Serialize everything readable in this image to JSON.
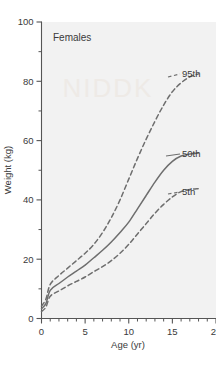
{
  "chart_data": {
    "type": "line",
    "title": "Females",
    "xlabel": "Age (yr)",
    "ylabel": "Weight (kg)",
    "xlim": [
      0,
      20
    ],
    "ylim": [
      0,
      100
    ],
    "xticks": [
      0,
      5,
      10,
      15,
      20
    ],
    "xtick_labels": [
      "0",
      "5",
      "10",
      "15",
      "20"
    ],
    "xminor_step": 1,
    "yticks": [
      0,
      20,
      40,
      60,
      80,
      100
    ],
    "ytick_labels": [
      "0",
      "20",
      "40",
      "60",
      "80",
      "100"
    ],
    "yminor_step": 10,
    "grid": false,
    "legend_position": "inline-right-annotations",
    "series": [
      {
        "name": "95th",
        "label": "95th",
        "style": "dashed",
        "color": "#6e6e6e",
        "x": [
          0,
          0.5,
          1,
          2,
          3,
          4,
          5,
          6,
          7,
          8,
          9,
          10,
          11,
          12,
          13,
          14,
          15,
          16,
          17,
          18
        ],
        "values": [
          4.2,
          6.5,
          11.5,
          14.5,
          17.0,
          19.5,
          22.0,
          25.0,
          29.0,
          34.0,
          40.0,
          47.0,
          54.0,
          60.5,
          66.5,
          72.0,
          76.5,
          79.5,
          81.5,
          82.5
        ]
      },
      {
        "name": "50th",
        "label": "50th",
        "style": "solid",
        "color": "#6e6e6e",
        "x": [
          0,
          0.5,
          1,
          2,
          3,
          4,
          5,
          6,
          7,
          8,
          9,
          10,
          11,
          12,
          13,
          14,
          15,
          16,
          17,
          18
        ],
        "values": [
          3.3,
          5.0,
          9.5,
          11.8,
          14.0,
          16.0,
          18.0,
          20.5,
          23.0,
          25.8,
          29.0,
          32.5,
          37.0,
          41.5,
          46.0,
          50.0,
          53.0,
          54.8,
          55.5,
          55.8
        ]
      },
      {
        "name": "5th",
        "label": "5th",
        "style": "dashed",
        "color": "#6e6e6e",
        "x": [
          0,
          0.5,
          1,
          2,
          3,
          4,
          5,
          6,
          7,
          8,
          9,
          10,
          11,
          12,
          13,
          14,
          15,
          16,
          17,
          18
        ],
        "values": [
          2.4,
          3.8,
          7.5,
          9.3,
          11.0,
          12.5,
          14.0,
          15.8,
          17.5,
          19.5,
          22.0,
          25.0,
          28.5,
          32.0,
          35.5,
          38.5,
          41.0,
          42.8,
          43.5,
          43.8
        ]
      }
    ],
    "annotations": [
      {
        "text": "95th",
        "x": 18.9,
        "y": 83.0
      },
      {
        "text": "50th",
        "x": 18.9,
        "y": 56.0
      },
      {
        "text": "5th",
        "x": 18.9,
        "y": 44.5
      },
      {
        "text": "Females",
        "x": 1.3,
        "y": 94.0
      }
    ],
    "colors": {
      "curve": "#6e6e6e",
      "axis": "#555555",
      "text": "#3a3a3a",
      "plot_background": "#f2f2f2",
      "figure_background": "#ffffff"
    }
  }
}
